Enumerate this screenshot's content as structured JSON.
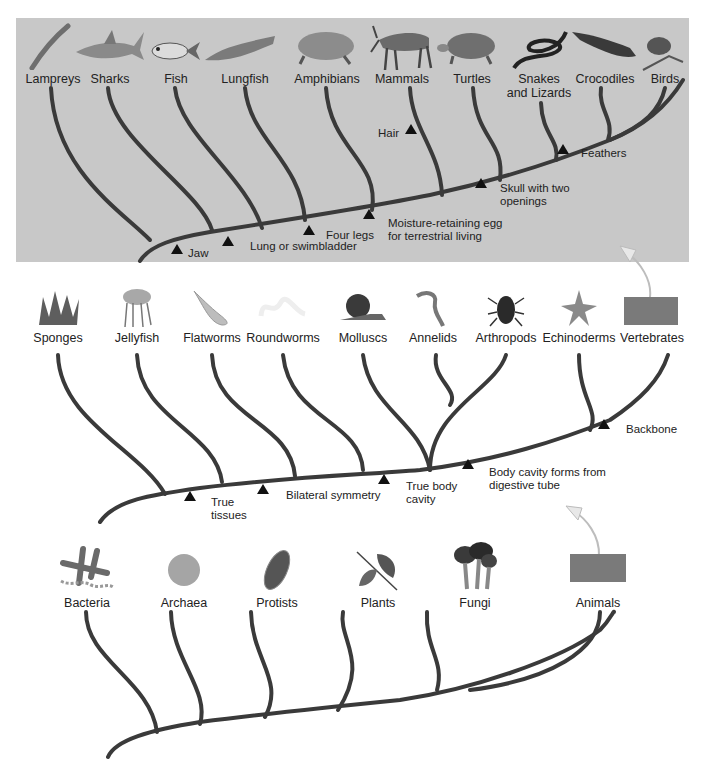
{
  "vertebrates": {
    "taxa": [
      {
        "label": "Lampreys",
        "icon": "lamprey-icon"
      },
      {
        "label": "Sharks",
        "icon": "shark-icon"
      },
      {
        "label": "Fish",
        "icon": "fish-icon"
      },
      {
        "label": "Lungfish",
        "icon": "lungfish-icon"
      },
      {
        "label": "Amphibians",
        "icon": "frog-icon"
      },
      {
        "label": "Mammals",
        "icon": "antelope-icon"
      },
      {
        "label": "Turtles",
        "icon": "turtle-icon"
      },
      {
        "label": "Snakes\nand Lizards",
        "icon": "snake-icon"
      },
      {
        "label": "Crocodiles",
        "icon": "crocodile-icon"
      },
      {
        "label": "Birds",
        "icon": "bird-icon"
      }
    ],
    "traits": {
      "jaw": "Jaw",
      "lung": "Lung or swimbladder",
      "legs": "Four legs",
      "egg1": "Moisture-retaining egg",
      "egg2": "for terrestrial living",
      "hair": "Hair",
      "skull1": "Skull with two",
      "skull2": "openings",
      "feathers": "Feathers"
    }
  },
  "invertebrates": {
    "taxa": [
      {
        "label": "Sponges",
        "icon": "sponge-icon"
      },
      {
        "label": "Jellyfish",
        "icon": "jellyfish-icon"
      },
      {
        "label": "Flatworms",
        "icon": "flatworm-icon"
      },
      {
        "label": "Roundworms",
        "icon": "roundworm-icon"
      },
      {
        "label": "Molluscs",
        "icon": "snail-icon"
      },
      {
        "label": "Annelids",
        "icon": "annelid-icon"
      },
      {
        "label": "Arthropods",
        "icon": "beetle-icon"
      },
      {
        "label": "Echinoderms",
        "icon": "starfish-icon"
      },
      {
        "label": "Vertebrates",
        "icon": "vertebrates-box"
      }
    ],
    "traits": {
      "tissues1": "True",
      "tissues2": "tissues",
      "bilateral": "Bilateral symmetry",
      "cavity1": "True body",
      "cavity2": "cavity",
      "digestive1": "Body cavity forms from",
      "digestive2": "digestive tube",
      "backbone": "Backbone"
    }
  },
  "kingdoms": {
    "taxa": [
      {
        "label": "Bacteria",
        "icon": "bacteria-icon"
      },
      {
        "label": "Archaea",
        "icon": "archaea-icon"
      },
      {
        "label": "Protists",
        "icon": "protist-icon"
      },
      {
        "label": "Plants",
        "icon": "leaf-icon"
      },
      {
        "label": "Fungi",
        "icon": "mushroom-icon"
      },
      {
        "label": "Animals",
        "icon": "animals-box"
      }
    ]
  },
  "colors": {
    "panel": "#c8c8c8",
    "branch": "#3a3a3a",
    "box": "#7a7a7a"
  }
}
